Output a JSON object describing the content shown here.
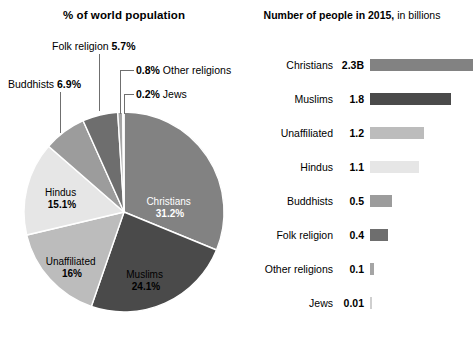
{
  "pie_panel": {
    "title": "% of world population"
  },
  "bar_panel": {
    "title_strong": "Number of people in 2015,",
    "title_rest": " in billions"
  },
  "callouts": {
    "folk": {
      "name": "Folk religion ",
      "value": "5.7%"
    },
    "buddhists": {
      "name": "Buddhists ",
      "value": "6.9%"
    },
    "other": {
      "value": "0.8%",
      "name": " Other religions"
    },
    "jews": {
      "value": "0.2%",
      "name": " Jews"
    }
  },
  "pie_inner_labels": {
    "christians": {
      "name": "Christians",
      "value": "31.2%"
    },
    "muslims": {
      "name": "Muslims",
      "value": "24.1%"
    },
    "unaffiliated": {
      "name": "Unaffiliated",
      "value": "16%"
    },
    "hindus": {
      "name": "Hindus",
      "value": "15.1%"
    }
  },
  "bars": [
    {
      "name": "Christians",
      "value": "2.3B",
      "number": 2.3,
      "color": "#828282"
    },
    {
      "name": "Muslims",
      "value": "1.8",
      "number": 1.8,
      "color": "#4a4a4a"
    },
    {
      "name": "Unaffiliated",
      "value": "1.2",
      "number": 1.2,
      "color": "#bcbcbc"
    },
    {
      "name": "Hindus",
      "value": "1.1",
      "number": 1.1,
      "color": "#e6e6e6"
    },
    {
      "name": "Buddhists",
      "value": "0.5",
      "number": 0.5,
      "color": "#9c9c9c"
    },
    {
      "name": "Folk religion",
      "value": "0.4",
      "number": 0.4,
      "color": "#6e6e6e"
    },
    {
      "name": "Other religions",
      "value": "0.1",
      "number": 0.1,
      "color": "#a5a5a5"
    },
    {
      "name": "Jews",
      "value": "0.01",
      "number": 0.01,
      "color": "#cfcfcf"
    }
  ],
  "chart_data": [
    {
      "type": "pie",
      "title": "% of world population",
      "categories": [
        "Christians",
        "Muslims",
        "Unaffiliated",
        "Hindus",
        "Buddhists",
        "Folk religion",
        "Other religions",
        "Jews"
      ],
      "values": [
        31.2,
        24.1,
        16,
        15.1,
        6.9,
        5.7,
        0.8,
        0.2
      ],
      "unit": "% of world population",
      "colors": [
        "#828282",
        "#4a4a4a",
        "#bcbcbc",
        "#e6e6e6",
        "#9c9c9c",
        "#6e6e6e",
        "#a5a5a5",
        "#cfcfcf"
      ],
      "start_angle_deg": 0,
      "direction": "clockwise",
      "legend": "none",
      "labels_inside": [
        "Christians 31.2%",
        "Muslims 24.1%",
        "Unaffiliated 16%",
        "Hindus 15.1%"
      ],
      "labels_outside": [
        "Buddhists 6.9%",
        "Folk religion 5.7%",
        "0.8% Other religions",
        "0.2% Jews"
      ]
    },
    {
      "type": "bar",
      "orientation": "horizontal",
      "title": "Number of people in 2015, in billions",
      "categories": [
        "Christians",
        "Muslims",
        "Unaffiliated",
        "Hindus",
        "Buddhists",
        "Folk religion",
        "Other religions",
        "Jews"
      ],
      "values": [
        2.3,
        1.8,
        1.2,
        1.1,
        0.5,
        0.4,
        0.1,
        0.01
      ],
      "value_labels": [
        "2.3B",
        "1.8",
        "1.2",
        "1.1",
        "0.5",
        "0.4",
        "0.1",
        "0.01"
      ],
      "xlabel": "billions of people",
      "ylabel": "",
      "xlim": [
        0,
        2.3
      ],
      "grid": false,
      "legend": "none",
      "colors": [
        "#828282",
        "#4a4a4a",
        "#bcbcbc",
        "#e6e6e6",
        "#9c9c9c",
        "#6e6e6e",
        "#a5a5a5",
        "#cfcfcf"
      ]
    }
  ]
}
